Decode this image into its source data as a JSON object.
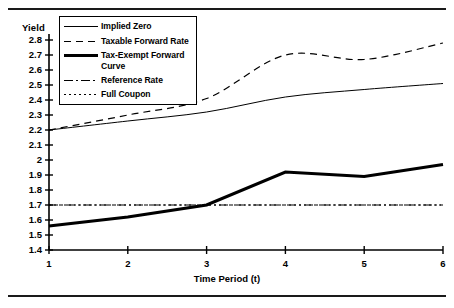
{
  "chart_data": {
    "type": "line",
    "title": "",
    "xlabel": "Time Period (t)",
    "ylabel": "Yield",
    "x": [
      1,
      2,
      3,
      4,
      5,
      6
    ],
    "xtick_labels": [
      "1",
      "2",
      "3",
      "4",
      "5",
      "6"
    ],
    "xlim": [
      1,
      6
    ],
    "ylim": [
      1.4,
      2.8
    ],
    "ytick_labels": [
      "2.8",
      "2.7",
      "2.6",
      "2.5",
      "2.4",
      "2.3",
      "2.2",
      "2.1",
      "2",
      "1.9",
      "1.8",
      "1.7",
      "1.6",
      "1.5",
      "1.4"
    ],
    "ytick_values": [
      2.8,
      2.7,
      2.6,
      2.5,
      2.4,
      2.3,
      2.2,
      2.1,
      2.0,
      1.9,
      1.8,
      1.7,
      1.6,
      1.5,
      1.4
    ],
    "grid": false,
    "legend_position": "top-left-inside",
    "series": [
      {
        "name": "Implied Zero",
        "style": "solid-thin",
        "color": "#000000",
        "values": [
          2.2,
          2.26,
          2.32,
          2.42,
          2.47,
          2.51
        ]
      },
      {
        "name": "Taxable Forward Rate",
        "style": "dashed",
        "color": "#000000",
        "values": [
          2.2,
          2.3,
          2.41,
          2.7,
          2.67,
          2.78
        ]
      },
      {
        "name": "Tax-Exempt Forward Curve",
        "style": "solid-thick",
        "color": "#000000",
        "values": [
          1.56,
          1.62,
          1.7,
          1.92,
          1.89,
          1.97
        ]
      },
      {
        "name": "Reference Rate",
        "style": "dash-dot",
        "color": "#000000",
        "values": [
          1.7,
          1.7,
          1.7,
          1.7,
          1.7,
          1.7
        ]
      },
      {
        "name": "Full Coupon",
        "style": "dotted",
        "color": "#000000",
        "values": [
          1.7,
          1.7,
          1.7,
          1.7,
          1.7,
          1.7
        ]
      }
    ]
  },
  "legend": {
    "items": [
      {
        "label": "Implied Zero",
        "style": "solid-thin"
      },
      {
        "label": "Taxable Forward Rate",
        "style": "dashed"
      },
      {
        "label": "Tax-Exempt Forward Curve",
        "style": "solid-thick"
      },
      {
        "label": "Reference Rate",
        "style": "dash-dot"
      },
      {
        "label": "Full Coupon",
        "style": "dotted"
      }
    ]
  }
}
